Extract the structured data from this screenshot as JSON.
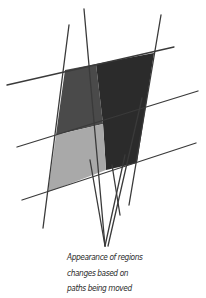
{
  "figure": {
    "caption_lines": [
      "Appearance of regions",
      "changes based on",
      "paths being moved"
    ],
    "region_colors": {
      "top_left": "#4a4a4a",
      "right": "#2b2b2b",
      "bottom_left": "#a9a9a9"
    },
    "line_color": "#3a3a3a",
    "regions": [
      "top-left region",
      "right region",
      "bottom-left region"
    ],
    "paths": [
      "horizontal path 1",
      "horizontal path 2",
      "horizontal path 3",
      "left path",
      "middle path",
      "right path"
    ]
  }
}
